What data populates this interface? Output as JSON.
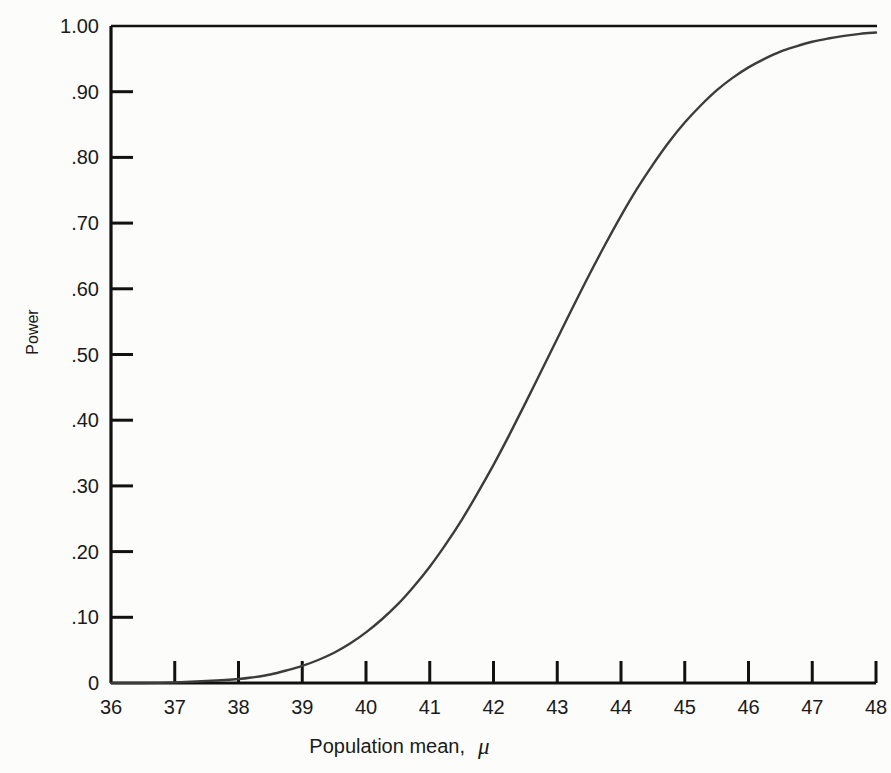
{
  "chart_data": {
    "type": "line",
    "title": "",
    "subtitle": "",
    "xlabel": "Population mean, μ",
    "ylabel": "Power",
    "xlim": [
      36,
      48
    ],
    "ylim": [
      0,
      1.0
    ],
    "grid": false,
    "legend": "none",
    "x_tick_labels": [
      "36",
      "37",
      "38",
      "39",
      "40",
      "41",
      "42",
      "43",
      "44",
      "45",
      "46",
      "47",
      "48"
    ],
    "x_tick_values": [
      36,
      37,
      38,
      39,
      40,
      41,
      42,
      43,
      44,
      45,
      46,
      47,
      48
    ],
    "y_tick_labels": [
      "1.00",
      ".90",
      ".80",
      ".70",
      ".60",
      ".50",
      ".40",
      ".30",
      ".20",
      ".10",
      "0"
    ],
    "y_tick_values": [
      1.0,
      0.9,
      0.8,
      0.7,
      0.6,
      0.5,
      0.4,
      0.3,
      0.2,
      0.1,
      0
    ],
    "series": [
      {
        "name": "Power function",
        "x": [
          36.0,
          36.5,
          37.0,
          37.5,
          38.0,
          38.25,
          38.5,
          38.75,
          39.0,
          39.25,
          39.5,
          39.75,
          40.0,
          40.25,
          40.5,
          40.75,
          41.0,
          41.25,
          41.5,
          41.75,
          42.0,
          42.25,
          42.5,
          42.75,
          43.0,
          43.25,
          43.5,
          43.75,
          44.0,
          44.25,
          44.5,
          44.75,
          45.0,
          45.25,
          45.5,
          45.75,
          46.0,
          46.25,
          46.5,
          46.75,
          47.0,
          47.25,
          47.5,
          47.75,
          48.0
        ],
        "y": [
          0.0,
          0.0,
          0.001,
          0.003,
          0.006,
          0.009,
          0.013,
          0.019,
          0.026,
          0.035,
          0.046,
          0.06,
          0.077,
          0.097,
          0.12,
          0.147,
          0.177,
          0.211,
          0.248,
          0.289,
          0.332,
          0.378,
          0.426,
          0.475,
          0.524,
          0.573,
          0.621,
          0.667,
          0.711,
          0.752,
          0.789,
          0.823,
          0.853,
          0.879,
          0.902,
          0.921,
          0.937,
          0.95,
          0.961,
          0.969,
          0.976,
          0.981,
          0.985,
          0.988,
          0.99
        ]
      }
    ]
  },
  "axes": {
    "y_axis_title": "Power",
    "x_axis_title_text": "Population mean,",
    "x_axis_title_symbol": "μ"
  }
}
